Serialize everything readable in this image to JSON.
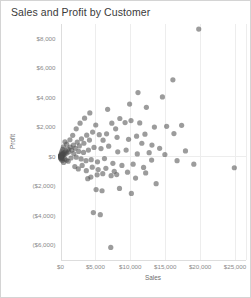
{
  "header": {
    "title": "Sales and Profit by Customer"
  },
  "chart_data": {
    "type": "scatter",
    "title": "Sales and Profit by Customer",
    "xlabel": "Sales",
    "ylabel": "Profit",
    "xlim": [
      0,
      26500
    ],
    "ylim": [
      -7000,
      9000
    ],
    "grid": true,
    "legend": null,
    "xticks": [
      0,
      5000,
      10000,
      15000,
      20000,
      25000
    ],
    "xtick_labels": [
      "$0",
      "$5,000",
      "$10,000",
      "$15,000",
      "$20,000",
      "$25,000"
    ],
    "yticks": [
      8000,
      6000,
      4000,
      2000,
      0,
      -2000,
      -4000,
      -6000
    ],
    "ytick_labels": [
      "$8,000",
      "$6,000",
      "$4,000",
      "$2,000",
      "$0",
      "($2,000)",
      "($4,000)",
      "($6,000)"
    ],
    "marker": {
      "shape": "circle",
      "color": "#4a4a4a",
      "opacity": 0.55,
      "size_px": 5.2
    },
    "series": [
      {
        "name": "Customer",
        "points": [
          [
            19800,
            8620
          ],
          [
            16100,
            5180
          ],
          [
            14600,
            4020
          ],
          [
            12300,
            3320
          ],
          [
            11350,
            2260
          ],
          [
            13450,
            1980
          ],
          [
            15200,
            2030
          ],
          [
            16250,
            1540
          ],
          [
            17350,
            2100
          ],
          [
            12100,
            1500
          ],
          [
            10900,
            1360
          ],
          [
            9750,
            1150
          ],
          [
            11650,
            880
          ],
          [
            13100,
            760
          ],
          [
            14200,
            540
          ],
          [
            9250,
            2280
          ],
          [
            8500,
            2560
          ],
          [
            7900,
            1860
          ],
          [
            10100,
            2420
          ],
          [
            7350,
            2240
          ],
          [
            6600,
            1520
          ],
          [
            8100,
            1280
          ],
          [
            6100,
            1090
          ],
          [
            5550,
            1460
          ],
          [
            5050,
            2120
          ],
          [
            4600,
            1640
          ],
          [
            4150,
            1100
          ],
          [
            3750,
            1430
          ],
          [
            3350,
            880
          ],
          [
            3000,
            1180
          ],
          [
            2700,
            700
          ],
          [
            2400,
            960
          ],
          [
            2100,
            540
          ],
          [
            1850,
            760
          ],
          [
            1600,
            420
          ],
          [
            1400,
            620
          ],
          [
            1200,
            300
          ],
          [
            1050,
            480
          ],
          [
            900,
            220
          ],
          [
            780,
            360
          ],
          [
            660,
            150
          ],
          [
            560,
            260
          ],
          [
            470,
            95
          ],
          [
            390,
            180
          ],
          [
            320,
            60
          ],
          [
            260,
            130
          ],
          [
            210,
            35
          ],
          [
            170,
            85
          ],
          [
            135,
            20
          ],
          [
            105,
            55
          ],
          [
            80,
            10
          ],
          [
            60,
            35
          ],
          [
            45,
            5
          ],
          [
            32,
            22
          ],
          [
            22,
            2
          ],
          [
            15,
            14
          ],
          [
            1500,
            -120
          ],
          [
            1900,
            180
          ],
          [
            2250,
            -60
          ],
          [
            2600,
            330
          ],
          [
            2950,
            -180
          ],
          [
            3300,
            260
          ],
          [
            3650,
            -300
          ],
          [
            4000,
            420
          ],
          [
            4400,
            -230
          ],
          [
            4800,
            600
          ],
          [
            5300,
            -380
          ],
          [
            5800,
            520
          ],
          [
            6300,
            -160
          ],
          [
            6900,
            680
          ],
          [
            7500,
            -480
          ],
          [
            8200,
            300
          ],
          [
            8800,
            -620
          ],
          [
            9400,
            420
          ],
          [
            10400,
            -540
          ],
          [
            11000,
            160
          ],
          [
            11900,
            -760
          ],
          [
            12700,
            240
          ],
          [
            3900,
            -1520
          ],
          [
            4350,
            -1410
          ],
          [
            5250,
            -1260
          ],
          [
            6050,
            -1180
          ],
          [
            7250,
            -1320
          ],
          [
            8050,
            -1240
          ],
          [
            9600,
            -1080
          ],
          [
            10750,
            -1480
          ],
          [
            12200,
            -1130
          ],
          [
            13050,
            -260
          ],
          [
            5100,
            -2260
          ],
          [
            5950,
            -2340
          ],
          [
            8450,
            -2180
          ],
          [
            10150,
            -2520
          ],
          [
            4700,
            -3820
          ],
          [
            5700,
            -3960
          ],
          [
            7200,
            -6180
          ],
          [
            24900,
            -780
          ],
          [
            19100,
            -540
          ],
          [
            14950,
            120
          ],
          [
            17900,
            360
          ],
          [
            13700,
            -1860
          ],
          [
            16700,
            -300
          ],
          [
            2250,
            1860
          ],
          [
            2800,
            2240
          ],
          [
            3450,
            2580
          ],
          [
            4200,
            2940
          ],
          [
            1750,
            1420
          ],
          [
            6750,
            3180
          ],
          [
            9900,
            3540
          ],
          [
            11100,
            4320
          ],
          [
            1350,
            1120
          ],
          [
            880,
            820
          ],
          [
            640,
            980
          ],
          [
            420,
            640
          ],
          [
            300,
            470
          ],
          [
            190,
            310
          ],
          [
            120,
            190
          ],
          [
            70,
            120
          ],
          [
            1100,
            -340
          ],
          [
            850,
            -260
          ],
          [
            620,
            -180
          ],
          [
            450,
            -420
          ],
          [
            330,
            -130
          ],
          [
            240,
            -290
          ],
          [
            170,
            -90
          ],
          [
            110,
            -200
          ],
          [
            75,
            -55
          ],
          [
            48,
            -140
          ],
          [
            30,
            -40
          ],
          [
            18,
            -95
          ],
          [
            2050,
            -700
          ],
          [
            2550,
            -860
          ],
          [
            3100,
            -620
          ],
          [
            3700,
            -980
          ],
          [
            4550,
            -740
          ],
          [
            5400,
            -900
          ],
          [
            6500,
            -820
          ],
          [
            7700,
            -1020
          ]
        ]
      }
    ]
  }
}
